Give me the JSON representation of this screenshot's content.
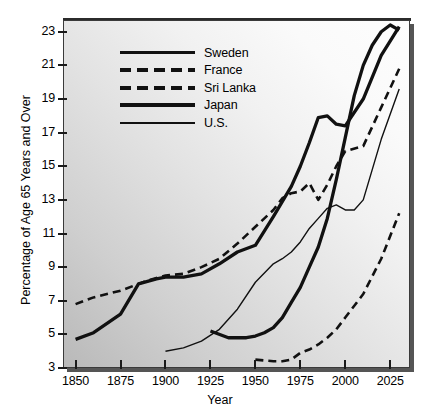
{
  "chart_data": {
    "type": "line",
    "title": "",
    "xlabel": "Year",
    "ylabel": "Percentage of Age 65 Years and Over",
    "xlim": [
      1843,
      2036
    ],
    "ylim": [
      3,
      23.7
    ],
    "grid": false,
    "legend_position": "upper-left-inside",
    "xticks": [
      1850,
      1875,
      1900,
      1925,
      1950,
      1975,
      2000,
      2025
    ],
    "xticklabels": [
      "1850",
      "1875",
      "1900",
      "1925",
      "1950",
      "1975",
      "2000",
      "2025"
    ],
    "yticks": [
      3,
      5,
      7,
      9,
      11,
      13,
      15,
      17,
      19,
      21,
      23
    ],
    "yticklabels": [
      "3",
      "5",
      "7",
      "9",
      "11",
      "13",
      "15",
      "17",
      "19",
      "21",
      "23"
    ],
    "series": [
      {
        "name": "Sweden",
        "style": "solid",
        "width": "thick",
        "color": "#111111",
        "x": [
          1850,
          1860,
          1875,
          1885,
          1895,
          1900,
          1910,
          1920,
          1930,
          1940,
          1950,
          1960,
          1970,
          1975,
          1980,
          1985,
          1990,
          1995,
          2000,
          2010,
          2020,
          2030
        ],
        "y": [
          4.7,
          5.1,
          6.2,
          8.0,
          8.3,
          8.4,
          8.4,
          8.6,
          9.2,
          9.9,
          10.3,
          12.0,
          13.8,
          15.0,
          16.4,
          17.9,
          18.0,
          17.5,
          17.4,
          19.0,
          21.6,
          23.3
        ]
      },
      {
        "name": "France",
        "style": "dashed",
        "width": "medium",
        "color": "#111111",
        "x": [
          1850,
          1860,
          1875,
          1890,
          1900,
          1910,
          1920,
          1930,
          1940,
          1950,
          1960,
          1965,
          1970,
          1975,
          1980,
          1985,
          1990,
          1995,
          2000,
          2010,
          2020,
          2030
        ],
        "y": [
          6.8,
          7.2,
          7.6,
          8.2,
          8.5,
          8.6,
          9.0,
          9.5,
          10.4,
          11.4,
          12.4,
          13.1,
          13.4,
          13.5,
          14.0,
          13.0,
          13.9,
          15.0,
          15.9,
          16.2,
          18.5,
          20.8
        ]
      },
      {
        "name": "Sri Lanka",
        "style": "dashed",
        "width": "medium",
        "color": "#111111",
        "x": [
          1950,
          1960,
          1965,
          1970,
          1975,
          1980,
          1985,
          1990,
          1995,
          2000,
          2010,
          2020,
          2030
        ],
        "y": [
          3.5,
          3.4,
          3.4,
          3.5,
          3.9,
          4.1,
          4.4,
          4.8,
          5.3,
          6.0,
          7.4,
          9.5,
          12.2
        ]
      },
      {
        "name": "Japan",
        "style": "solid",
        "width": "thick",
        "color": "#111111",
        "x": [
          1925,
          1935,
          1945,
          1950,
          1955,
          1960,
          1965,
          1970,
          1975,
          1980,
          1985,
          1990,
          1995,
          2000,
          2005,
          2010,
          2015,
          2020,
          2025,
          2030
        ],
        "y": [
          5.2,
          4.8,
          4.8,
          4.9,
          5.1,
          5.4,
          6.0,
          6.9,
          7.8,
          9.0,
          10.2,
          11.9,
          14.2,
          16.7,
          19.2,
          21.0,
          22.2,
          23.0,
          23.4,
          23.1
        ]
      },
      {
        "name": "U.S.",
        "style": "solid",
        "width": "thin",
        "color": "#111111",
        "x": [
          1900,
          1910,
          1920,
          1930,
          1940,
          1950,
          1960,
          1965,
          1970,
          1975,
          1980,
          1985,
          1990,
          1995,
          2000,
          2005,
          2010,
          2015,
          2020,
          2030
        ],
        "y": [
          4.0,
          4.2,
          4.6,
          5.3,
          6.5,
          8.1,
          9.2,
          9.5,
          9.9,
          10.5,
          11.3,
          11.9,
          12.5,
          12.7,
          12.4,
          12.4,
          13.0,
          14.8,
          16.6,
          19.6
        ]
      }
    ],
    "legend": [
      {
        "label": "Sweden",
        "key": "solid-thick"
      },
      {
        "label": "France",
        "key": "dashed"
      },
      {
        "label": "Sri Lanka",
        "key": "dashed"
      },
      {
        "label": "Japan",
        "key": "solid-thick"
      },
      {
        "label": "U.S.",
        "key": "solid-thin"
      }
    ]
  }
}
